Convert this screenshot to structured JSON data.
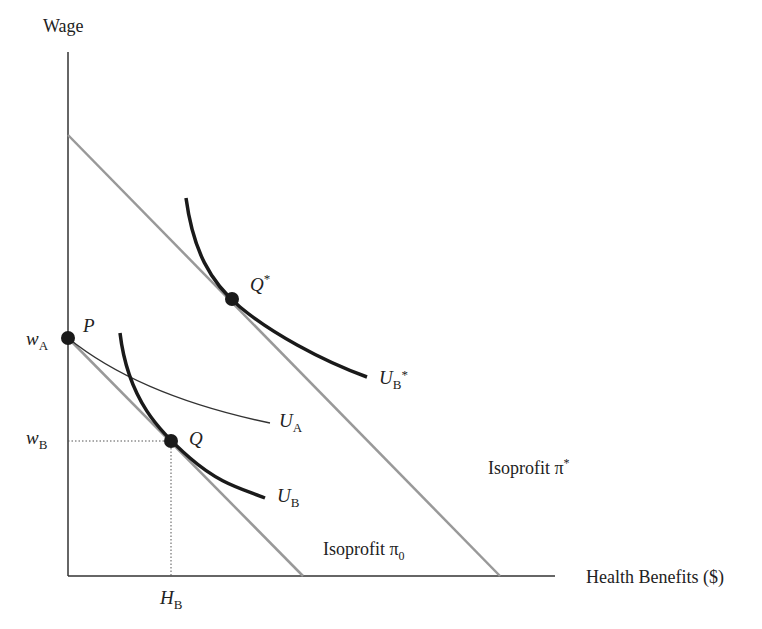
{
  "axes": {
    "y_label": "Wage",
    "x_label": "Health Benefits ($)"
  },
  "tick_labels": {
    "wA": {
      "main": "w",
      "sub": "A"
    },
    "wB": {
      "main": "w",
      "sub": "B"
    },
    "HB": {
      "main": "H",
      "sub": "B"
    }
  },
  "points": {
    "P": "P",
    "Q": "Q",
    "Qstar": {
      "main": "Q",
      "sup": "*"
    }
  },
  "curves": {
    "UA": {
      "main": "U",
      "sub": "A"
    },
    "UB": {
      "main": "U",
      "sub": "B"
    },
    "UBstar": {
      "main": "U",
      "sub": "B",
      "sup": "*"
    }
  },
  "isoprofit": {
    "pi0": {
      "text": "Isoprofit ",
      "sym": "π",
      "sub": "0"
    },
    "pistar": {
      "text": "Isoprofit ",
      "sym": "π",
      "sup": "*"
    }
  },
  "colors": {
    "axis": "#333333",
    "isoprofit_line": "#999999",
    "indifference_thick": "#1a1a1a",
    "indifference_thin": "#333333",
    "guide_dotted": "#555555",
    "point": "#1a1a1a"
  }
}
